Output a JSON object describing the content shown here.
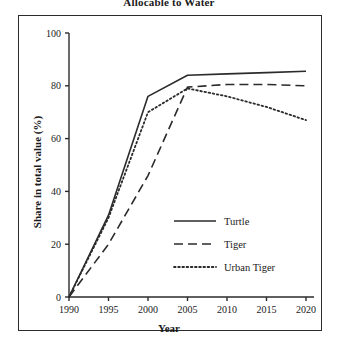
{
  "chart_data": {
    "type": "line",
    "title": "Allocable to Water",
    "xlabel": "Year",
    "ylabel": "Share in total value (%)",
    "xlim": [
      1990,
      2020
    ],
    "ylim": [
      0,
      100
    ],
    "xticks": [
      "1990",
      "1995",
      "2000",
      "2005",
      "2010",
      "2015",
      "2020"
    ],
    "yticks": [
      "0",
      "20",
      "40",
      "60",
      "80",
      "100"
    ],
    "grid": false,
    "legend_position": "lower right",
    "x": [
      1990,
      1995,
      2000,
      2005,
      2010,
      2015,
      2020
    ],
    "series": [
      {
        "name": "Turtle",
        "style": "solid",
        "values": [
          0,
          31,
          76,
          84,
          84.5,
          85,
          85.5
        ]
      },
      {
        "name": "Tiger",
        "style": "dashed",
        "values": [
          0,
          20,
          46,
          79.5,
          80.5,
          80.5,
          80
        ]
      },
      {
        "name": "Urban Tiger",
        "style": "dotted",
        "values": [
          0,
          30,
          70,
          79,
          76,
          72,
          67
        ]
      }
    ]
  },
  "legend": {
    "items": [
      {
        "label": "Turtle"
      },
      {
        "label": "Tiger"
      },
      {
        "label": "Urban Tiger"
      }
    ]
  },
  "colors": {
    "line": "#2b2b2b",
    "frame": "#2b2b2b",
    "background": "#ffffff"
  }
}
